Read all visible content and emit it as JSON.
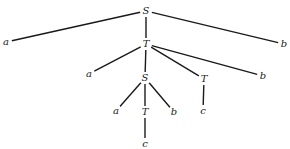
{
  "diagram": {
    "type": "parse-tree",
    "nodes": [
      {
        "id": "n0",
        "label": "S",
        "x": 146,
        "y": 11
      },
      {
        "id": "n1",
        "label": "a",
        "x": 6,
        "y": 42
      },
      {
        "id": "n2",
        "label": "T",
        "x": 146,
        "y": 44
      },
      {
        "id": "n3",
        "label": "b",
        "x": 284,
        "y": 44
      },
      {
        "id": "n4",
        "label": "a",
        "x": 89,
        "y": 74
      },
      {
        "id": "n5",
        "label": "S",
        "x": 145,
        "y": 78
      },
      {
        "id": "n6",
        "label": "T",
        "x": 204,
        "y": 79
      },
      {
        "id": "n7",
        "label": "b",
        "x": 263,
        "y": 76
      },
      {
        "id": "n8",
        "label": "a",
        "x": 116,
        "y": 111
      },
      {
        "id": "n9",
        "label": "T",
        "x": 145,
        "y": 112
      },
      {
        "id": "n10",
        "label": "b",
        "x": 174,
        "y": 112
      },
      {
        "id": "n11",
        "label": "c",
        "x": 203,
        "y": 111
      },
      {
        "id": "n12",
        "label": "c",
        "x": 145,
        "y": 144
      }
    ],
    "edges": [
      [
        "n0",
        "n1"
      ],
      [
        "n0",
        "n2"
      ],
      [
        "n0",
        "n3"
      ],
      [
        "n2",
        "n4"
      ],
      [
        "n2",
        "n5"
      ],
      [
        "n2",
        "n6"
      ],
      [
        "n2",
        "n7"
      ],
      [
        "n5",
        "n8"
      ],
      [
        "n5",
        "n9"
      ],
      [
        "n5",
        "n10"
      ],
      [
        "n6",
        "n11"
      ],
      [
        "n9",
        "n12"
      ]
    ]
  }
}
